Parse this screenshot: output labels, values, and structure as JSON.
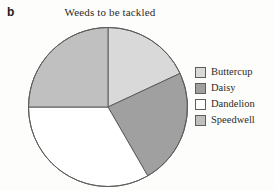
{
  "figure": {
    "panel_label": "b"
  },
  "chart_data": {
    "type": "pie",
    "title": "Weeds to be tackled",
    "xlabel": "",
    "ylabel": "",
    "grid": false,
    "legend_position": "right",
    "start_angle_deg": 0,
    "direction": "clockwise",
    "categories": [
      "Buttercup",
      "Daisy",
      "Dandelion",
      "Speedwell"
    ],
    "values": [
      18,
      24,
      33,
      25
    ],
    "units": "percent",
    "slice_angles_deg": [
      65,
      85,
      120,
      90
    ],
    "colors": [
      "#d9d9d9",
      "#a0a0a0",
      "#ffffff",
      "#c0c0c0"
    ],
    "slice_edge_color": "#5d5d5d",
    "slices": [
      {
        "label": "Buttercup",
        "value": 18,
        "angle_deg": 65,
        "color": "#d9d9d9"
      },
      {
        "label": "Daisy",
        "value": 24,
        "angle_deg": 85,
        "color": "#a0a0a0"
      },
      {
        "label": "Dandelion",
        "value": 33,
        "angle_deg": 120,
        "color": "#ffffff"
      },
      {
        "label": "Speedwell",
        "value": 25,
        "angle_deg": 90,
        "color": "#c0c0c0"
      }
    ]
  },
  "legend": {
    "items": [
      {
        "label": "Buttercup",
        "color": "#d9d9d9"
      },
      {
        "label": "Daisy",
        "color": "#a0a0a0"
      },
      {
        "label": "Dandelion",
        "color": "#ffffff"
      },
      {
        "label": "Speedwell",
        "color": "#c0c0c0"
      }
    ]
  }
}
